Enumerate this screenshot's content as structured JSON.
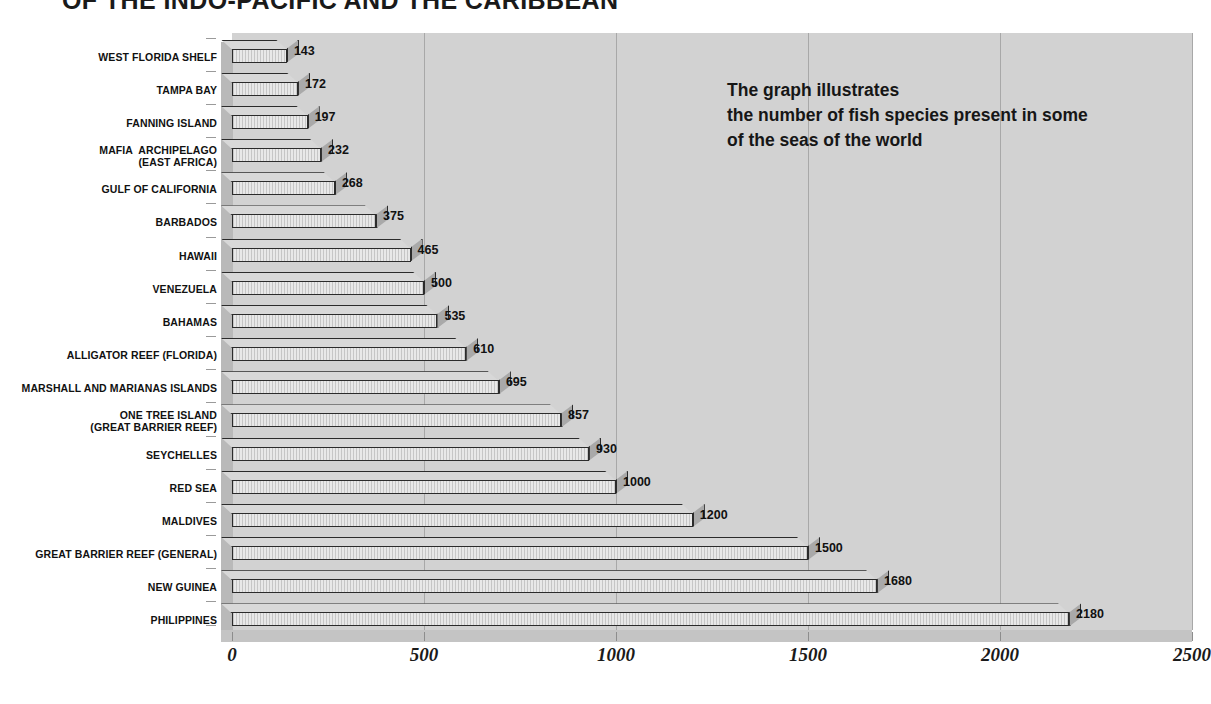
{
  "title": "OF THE INDO-PACIFIC AND THE CARIBBEAN",
  "annotation": "The graph illustrates\nthe number of fish species present in some\nof the seas of the world",
  "axis": {
    "ticks": [
      "0",
      "500",
      "1000",
      "1500",
      "2000",
      "2500"
    ],
    "tick_values": [
      0,
      500,
      1000,
      1500,
      2000,
      2500
    ],
    "xmin": 0,
    "xmax": 2500
  },
  "colors": {
    "wall": "#d2d2d2",
    "side_wall": "#b9b9b9",
    "floor": "#c4c4c4",
    "gridline": "#a8a8a8",
    "bar_front": "#e8e8e8",
    "bar_top": "#d8d8d8",
    "bar_side": "#a9a9a9",
    "bar_outline": "#2b2b2b",
    "text": "#111111",
    "background": "#ffffff"
  },
  "chart_data": {
    "type": "bar",
    "orientation": "horizontal",
    "title": "OF THE INDO-PACIFIC AND THE CARIBBEAN",
    "subtitle": "The graph illustrates the number of fish species present in some of the seas of the world",
    "xlabel": "",
    "ylabel": "",
    "xlim": [
      0,
      2500
    ],
    "grid": true,
    "legend": false,
    "categories": [
      "WEST FLORIDA SHELF",
      "TAMPA BAY",
      "FANNING ISLAND",
      "MAFIA  ARCHIPELAGO\n(EAST AFRICA)",
      "GULF OF CALIFORNIA",
      "BARBADOS",
      "HAWAII",
      "VENEZUELA",
      "BAHAMAS",
      "ALLIGATOR REEF (FLORIDA)",
      "MARSHALL AND MARIANAS ISLANDS",
      "ONE TREE ISLAND\n(GREAT BARRIER REEF)",
      "SEYCHELLES",
      "RED SEA",
      "MALDIVES",
      "GREAT BARRIER REEF (GENERAL)",
      "NEW GUINEA",
      "PHILIPPINES"
    ],
    "values": [
      143,
      172,
      197,
      232,
      268,
      375,
      465,
      500,
      535,
      610,
      695,
      857,
      930,
      1000,
      1200,
      1500,
      1680,
      2180
    ],
    "value_labels": [
      "143",
      "172",
      "197",
      "232",
      "268",
      "375",
      "465",
      "500",
      "535",
      "610",
      "695",
      "857",
      "930",
      "1000",
      "1200",
      "1500",
      "1680",
      "2180"
    ]
  }
}
